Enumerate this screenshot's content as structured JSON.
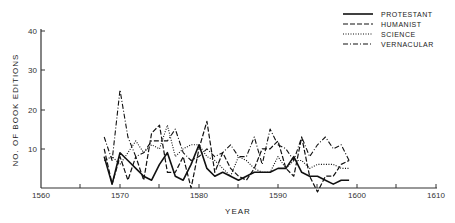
{
  "chart_data": {
    "type": "line",
    "title": "",
    "xlabel": "YEAR",
    "ylabel": "NO. OF BOOK EDITIONS",
    "xlim": [
      1560,
      1610
    ],
    "ylim": [
      0,
      40
    ],
    "x_ticks": [
      1560,
      1570,
      1580,
      1590,
      1600,
      1610
    ],
    "y_ticks": [
      10,
      20,
      30,
      40
    ],
    "grid": false,
    "legend_position": "top-right",
    "x": [
      1568,
      1569,
      1570,
      1571,
      1572,
      1573,
      1574,
      1575,
      1576,
      1577,
      1578,
      1579,
      1580,
      1581,
      1582,
      1583,
      1584,
      1585,
      1586,
      1587,
      1588,
      1589,
      1590,
      1591,
      1592,
      1593,
      1594,
      1595,
      1596,
      1597,
      1598,
      1599
    ],
    "series": [
      {
        "name": "PROTESTANT",
        "style": "solid",
        "values": [
          8,
          1,
          9,
          7,
          5,
          3,
          2,
          6,
          9,
          3,
          2,
          6,
          11,
          5,
          3,
          4,
          3,
          2,
          3,
          4,
          4,
          4,
          5,
          5,
          8,
          4,
          3,
          3,
          2,
          1,
          2,
          2
        ]
      },
      {
        "name": "HUMANIST",
        "style": "dashed",
        "values": [
          10,
          1,
          8,
          2,
          8,
          2,
          14,
          16,
          4,
          4,
          8,
          0,
          10,
          17,
          4,
          9,
          5,
          3,
          2,
          5,
          10,
          10,
          12,
          5,
          3,
          13,
          3,
          -1,
          3,
          3,
          6,
          7
        ]
      },
      {
        "name": "SCIENCE",
        "style": "dotted",
        "values": [
          7,
          8,
          6,
          9,
          12,
          9,
          11,
          10,
          16,
          8,
          10,
          11,
          11,
          8,
          7,
          5,
          3,
          8,
          7,
          5,
          4,
          4,
          8,
          5,
          7,
          7,
          5,
          6,
          6,
          6,
          5,
          5
        ]
      },
      {
        "name": "VERNACULAR",
        "style": "dashdot",
        "values": [
          13,
          7,
          25,
          13,
          8,
          9,
          12,
          12,
          12,
          15,
          9,
          7,
          8,
          10,
          8,
          9,
          11,
          8,
          8,
          13,
          6,
          15,
          11,
          10,
          7,
          13,
          8,
          11,
          13,
          10,
          11,
          7
        ]
      }
    ]
  },
  "legend": {
    "items": [
      {
        "label": "PROTESTANT"
      },
      {
        "label": "HUMANIST"
      },
      {
        "label": "SCIENCE"
      },
      {
        "label": "VERNACULAR"
      }
    ]
  },
  "axes": {
    "x_title": "YEAR",
    "y_title": "NO. OF BOOK EDITIONS",
    "x_tick_labels": [
      "1560",
      "1570",
      "1580",
      "1590",
      "1600",
      "1610"
    ],
    "y_tick_labels": [
      "10",
      "20",
      "30",
      "40"
    ]
  }
}
